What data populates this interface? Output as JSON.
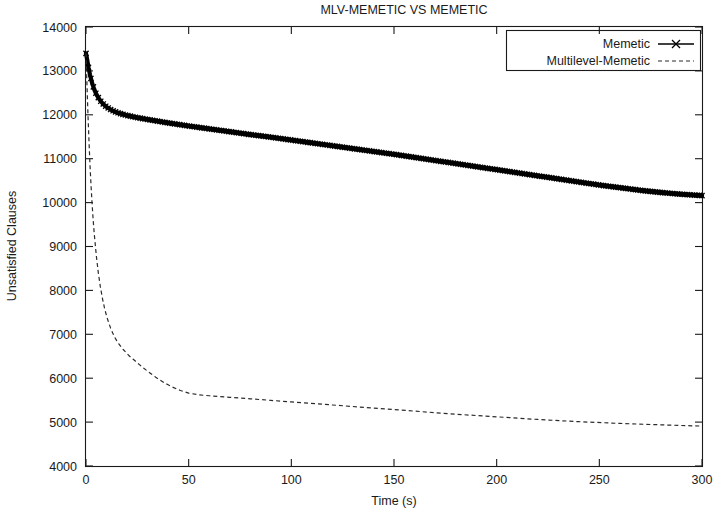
{
  "chart_data": {
    "type": "line",
    "title": "MLV-MEMETIC VS MEMETIC",
    "xlabel": "Time (s)",
    "ylabel": "Unsatisfied Clauses",
    "xlim": [
      0,
      300
    ],
    "ylim": [
      4000,
      14000
    ],
    "xticks": [
      0,
      50,
      100,
      150,
      200,
      250,
      300
    ],
    "yticks": [
      4000,
      5000,
      6000,
      7000,
      8000,
      9000,
      10000,
      11000,
      12000,
      13000,
      14000
    ],
    "xtick_labels": [
      "0",
      "50",
      "100",
      "150",
      "200",
      "250",
      "300"
    ],
    "ytick_labels": [
      "4000",
      "5000",
      "6000",
      "7000",
      "8000",
      "9000",
      "10000",
      "11000",
      "12000",
      "13000",
      "14000"
    ],
    "grid": false,
    "legend_position": "top-right",
    "series": [
      {
        "name": "Memetic",
        "style": "solid-with-x-markers",
        "color": "#000000",
        "x": [
          0,
          0.6,
          1.2,
          2,
          3,
          4,
          5,
          6,
          7,
          8,
          9,
          10,
          11,
          12,
          13,
          14,
          15,
          16,
          18,
          20,
          22,
          25,
          28,
          31,
          35,
          40,
          45,
          50,
          60,
          70,
          80,
          90,
          100,
          110,
          120,
          130,
          140,
          150,
          160,
          170,
          180,
          190,
          200,
          210,
          220,
          230,
          240,
          250,
          260,
          270,
          280,
          290,
          300
        ],
        "y": [
          13400,
          13250,
          13080,
          12900,
          12720,
          12580,
          12470,
          12390,
          12320,
          12265,
          12220,
          12180,
          12150,
          12120,
          12095,
          12075,
          12055,
          12040,
          12010,
          11985,
          11965,
          11935,
          11910,
          11885,
          11855,
          11815,
          11780,
          11745,
          11680,
          11615,
          11550,
          11490,
          11425,
          11360,
          11295,
          11230,
          11165,
          11100,
          11030,
          10960,
          10890,
          10820,
          10750,
          10680,
          10610,
          10540,
          10470,
          10400,
          10340,
          10280,
          10230,
          10190,
          10160
        ]
      },
      {
        "name": "Multilevel-Memetic",
        "style": "dashed",
        "color": "#2b2b2b",
        "x": [
          0,
          0.5,
          1,
          1.5,
          2,
          2.5,
          3,
          3.5,
          4,
          5,
          6,
          7,
          8,
          9,
          10,
          11,
          12,
          13,
          14,
          15,
          16,
          17,
          18,
          19,
          20,
          21,
          22,
          23,
          24,
          25,
          26,
          27,
          28,
          30,
          32,
          34,
          36,
          38,
          40,
          42,
          44,
          46,
          48,
          50,
          55,
          60,
          70,
          80,
          90,
          100,
          120,
          140,
          160,
          180,
          200,
          220,
          240,
          260,
          275,
          285,
          295,
          300
        ],
        "y": [
          13400,
          12650,
          11950,
          11350,
          10800,
          10350,
          9950,
          9600,
          9300,
          8800,
          8400,
          8080,
          7820,
          7600,
          7420,
          7270,
          7140,
          7030,
          6930,
          6850,
          6780,
          6720,
          6660,
          6610,
          6560,
          6510,
          6470,
          6430,
          6390,
          6350,
          6310,
          6270,
          6230,
          6160,
          6090,
          6020,
          5960,
          5900,
          5850,
          5800,
          5760,
          5720,
          5690,
          5660,
          5620,
          5600,
          5565,
          5530,
          5495,
          5460,
          5390,
          5320,
          5250,
          5180,
          5120,
          5060,
          5010,
          4970,
          4945,
          4930,
          4915,
          4910
        ]
      }
    ]
  }
}
